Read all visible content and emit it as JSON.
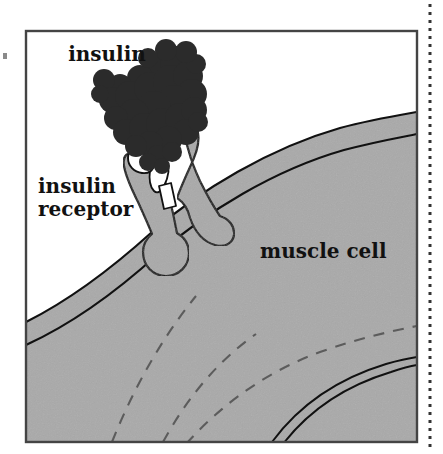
{
  "figure": {
    "name": "insulin-receptor-muscle-cell-diagram",
    "type": "scientific-illustration",
    "labels": {
      "insulin": "insulin",
      "receptor_line1": "insulin",
      "receptor_line2": "receptor",
      "muscle_cell": "muscle cell"
    },
    "colors": {
      "background": "#ffffff",
      "cell_fill": "#a9a9a9",
      "membrane_fill": "#a9a9a9",
      "receptor_fill": "#a9a9a9",
      "insulin_fill": "#2b2b2b",
      "outline": "#111111",
      "frame": "#444444",
      "margin_rule": "#333333",
      "label_text": "#111111"
    },
    "elements": {
      "frame": "rectangular-border",
      "margin_rule": "vertical-dotted-rule-right",
      "cell": "muscle-cell-body",
      "membrane": "plasma-membrane-band",
      "receptor": "insulin-receptor-transmembrane-protein",
      "insulin": "insulin-space-filling-molecule",
      "interior_dashes": 3,
      "interior_arc": "double-line-arc"
    }
  }
}
